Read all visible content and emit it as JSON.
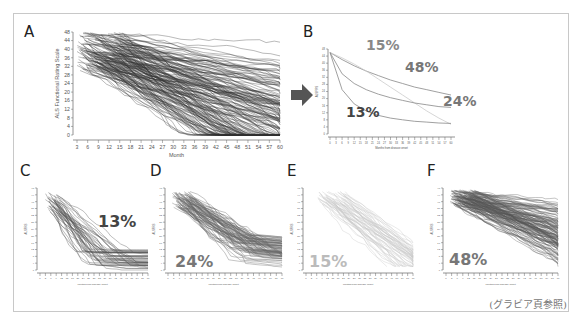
{
  "caption": "(グラビア頁参照)",
  "arrow_color": "#555555",
  "chart_data": [
    {
      "id": "A",
      "type": "line",
      "title": "",
      "panel_label": "A",
      "xlabel": "Month",
      "ylabel": "ALS Functional Rating Scale",
      "x_ticks": [
        "3",
        "6",
        "9",
        "12",
        "15",
        "18",
        "21",
        "24",
        "27",
        "30",
        "33",
        "36",
        "39",
        "42",
        "45",
        "48",
        "51",
        "54",
        "57",
        "60"
      ],
      "y_ticks": [
        "0",
        "4",
        "8",
        "12",
        "16",
        "20",
        "24",
        "28",
        "32",
        "36",
        "40",
        "44",
        "48"
      ],
      "xlim": [
        3,
        60
      ],
      "ylim": [
        0,
        48
      ],
      "grid": false,
      "description": "Spaghetti plot of individual patient ALSFRS trajectories over time (many series, dark gray lines)",
      "series_count_estimate": 200,
      "line_color": "#333333"
    },
    {
      "id": "B",
      "type": "line",
      "panel_label": "B",
      "xlabel": "Months from disease onset",
      "ylabel": "ALSFRS",
      "x_ticks": [
        "0",
        "3",
        "6",
        "9",
        "12",
        "15",
        "18",
        "21",
        "24",
        "27",
        "30",
        "33",
        "36",
        "39",
        "42",
        "45",
        "48",
        "51",
        "54",
        "57",
        "60"
      ],
      "y_ticks": [
        "0",
        "4",
        "8",
        "12",
        "16",
        "20",
        "24",
        "28",
        "32",
        "36",
        "40",
        "44",
        "48"
      ],
      "xlim": [
        0,
        60
      ],
      "ylim": [
        0,
        48
      ],
      "x": [
        0,
        6,
        12,
        18,
        24,
        30,
        36,
        42,
        48,
        54,
        60
      ],
      "series": [
        {
          "name": "48%",
          "label_color": "#777777",
          "line_color": "#888888",
          "values": [
            46,
            42,
            38.5,
            35.5,
            33,
            30.5,
            28.5,
            26.5,
            25,
            23.5,
            22
          ]
        },
        {
          "name": "15%",
          "label_color": "#888888",
          "line_color": "#cccccc",
          "values": [
            46,
            43,
            39.5,
            35.5,
            31,
            26.5,
            22,
            17.5,
            13,
            9,
            5.5
          ]
        },
        {
          "name": "24%",
          "label_color": "#777777",
          "line_color": "#888888",
          "values": [
            46,
            34,
            28.5,
            25,
            22.5,
            20.5,
            19,
            17.5,
            16.5,
            15.5,
            15
          ]
        },
        {
          "name": "13%",
          "label_color": "#444444",
          "line_color": "#888888",
          "values": [
            46,
            25,
            17,
            13,
            10.5,
            9,
            8,
            7.2,
            6.7,
            6.2,
            6
          ]
        }
      ],
      "annotations": [
        "15%",
        "48%",
        "24%",
        "13%"
      ]
    },
    {
      "id": "C",
      "type": "line",
      "panel_label": "C",
      "annotation": "13%",
      "annotation_color": "#444444",
      "xlabel": "Months from disease onset",
      "ylabel": "ALSFRS",
      "xlim": [
        0,
        60
      ],
      "ylim": [
        0,
        48
      ],
      "description": "Subgroup trajectories: rapid early decline then plateau",
      "line_color": "#555555"
    },
    {
      "id": "D",
      "type": "line",
      "panel_label": "D",
      "annotation": "24%",
      "annotation_color": "#777777",
      "xlabel": "Months from disease onset",
      "ylabel": "ALSFRS",
      "xlim": [
        0,
        60
      ],
      "ylim": [
        0,
        48
      ],
      "description": "Subgroup trajectories: intermediate decline, leveling off",
      "line_color": "#666666"
    },
    {
      "id": "E",
      "type": "line",
      "panel_label": "E",
      "annotation": "15%",
      "annotation_color": "#bbbbbb",
      "xlabel": "Months from disease onset",
      "ylabel": "ALSFRS",
      "xlim": [
        0,
        60
      ],
      "ylim": [
        0,
        48
      ],
      "description": "Subgroup trajectories: steady near-linear decline",
      "line_color": "#c8c8c8"
    },
    {
      "id": "F",
      "type": "line",
      "panel_label": "F",
      "annotation": "48%",
      "annotation_color": "#777777",
      "xlabel": "Months from disease onset",
      "ylabel": "ALSFRS",
      "xlim": [
        0,
        60
      ],
      "ylim": [
        0,
        48
      ],
      "description": "Subgroup trajectories: slow decline",
      "line_color": "#555555"
    }
  ]
}
